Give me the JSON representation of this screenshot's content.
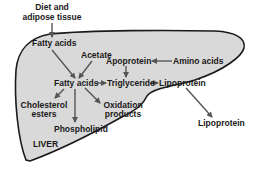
{
  "diagram": {
    "organ_label": "LIVER",
    "colors": {
      "organ_fill": "#d9d9d9",
      "organ_stroke": "#1a1a1a",
      "arrow": "#555555",
      "text": "#1a1a1a"
    },
    "nodes": {
      "diet_line1": "Diet and",
      "diet_line2": "adipose tissue",
      "fatty_acids_top": "Fatty acids",
      "acetate": "Acetate",
      "apoprotein": "Apoprotein",
      "amino_acids": "Amino acids",
      "fatty_acids_center": "Fatty acids",
      "triglyceride": "Triglyceride",
      "lipoprotein_inner": "Lipoprotein",
      "cholesterol_line1": "Cholesterol",
      "cholesterol_line2": "esters",
      "oxidation_line1": "Oxidation",
      "oxidation_line2": "products",
      "phospholipid": "Phospholipid",
      "lipoprotein_outer": "Lipoprotein"
    },
    "edges": [
      {
        "from": "Diet and adipose tissue",
        "to": "Fatty acids (top)"
      },
      {
        "from": "Fatty acids (top)",
        "to": "Fatty acids (center)"
      },
      {
        "from": "Acetate",
        "to": "Fatty acids (center)"
      },
      {
        "from": "Amino acids",
        "to": "Apoprotein"
      },
      {
        "from": "Apoprotein",
        "to": "Triglyceride"
      },
      {
        "from": "Fatty acids (center)",
        "to": "Triglyceride"
      },
      {
        "from": "Triglyceride",
        "to": "Lipoprotein"
      },
      {
        "from": "Fatty acids (center)",
        "to": "Cholesterol esters"
      },
      {
        "from": "Fatty acids (center)",
        "to": "Phospholipid"
      },
      {
        "from": "Fatty acids (center)",
        "to": "Oxidation products"
      },
      {
        "from": "Lipoprotein",
        "to": "Lipoprotein (outside liver)"
      }
    ]
  }
}
